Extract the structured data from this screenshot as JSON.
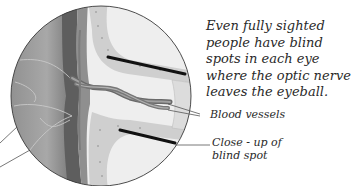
{
  "caption": {
    "lines": [
      "Even fully sighted",
      "people have blind",
      "spots in each eye",
      "where the optic nerve",
      "leaves the eyeball."
    ]
  },
  "labels": {
    "blood_vessels": "Blood vessels",
    "closeup_line1": "Close - up of",
    "closeup_line2": "blind spot"
  },
  "illustration": {
    "subject": "cross-section of eyeball at optic nerve / blind spot",
    "colors": {
      "outline": "#3a3a3a",
      "retina_dark": "#6e6e6e",
      "retina_mid": "#9a9a9a",
      "nerve_band": "#c9c9c9",
      "light_area": "#ececec",
      "vessel": "#7a7a7a",
      "black_bar": "#111111"
    }
  }
}
